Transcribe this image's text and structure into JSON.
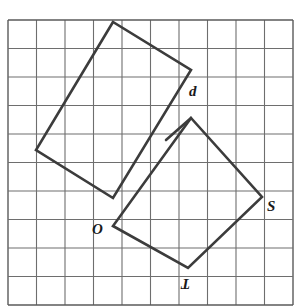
{
  "figure": {
    "background_color": "#ffffff",
    "width": 307,
    "height": 307
  },
  "grid": {
    "name": "square-lattice",
    "origin_x": 8,
    "origin_y": 20,
    "cell_size": 28.5,
    "columns": 10,
    "rows": 10,
    "line_color": "#6e6e6e",
    "line_width": 1.1,
    "border_color": "#5a5a5a",
    "border_width": 1.4
  },
  "shapes": [
    {
      "name": "square-upper-left",
      "type": "quadrilateral",
      "stroke_color": "#3c3c3c",
      "stroke_width": 2.6,
      "fill": "none",
      "points": "113,22 36,150 113,198 191,70"
    },
    {
      "name": "square-otsd",
      "type": "quadrilateral",
      "stroke_color": "#3c3c3c",
      "stroke_width": 2.6,
      "fill": "none",
      "points": "113,226 188,268 262,197 191,118"
    },
    {
      "name": "segment-d-to-overlap",
      "type": "polyline",
      "stroke_color": "#3c3c3c",
      "stroke_width": 2.6,
      "fill": "none",
      "points": "191,118 166,140"
    }
  ],
  "labels": [
    {
      "name": "vertex-label-d",
      "text": "d",
      "x": 189,
      "y": 84,
      "font_size": 15,
      "flipped": false
    },
    {
      "name": "vertex-label-s",
      "text": "S",
      "x": 267,
      "y": 199,
      "font_size": 15,
      "flipped": false
    },
    {
      "name": "vertex-label-o",
      "text": "O",
      "x": 92,
      "y": 222,
      "font_size": 15,
      "flipped": false
    },
    {
      "name": "vertex-label-t",
      "text": "T",
      "x": 181,
      "y": 276,
      "font_size": 15,
      "flipped": true
    }
  ]
}
